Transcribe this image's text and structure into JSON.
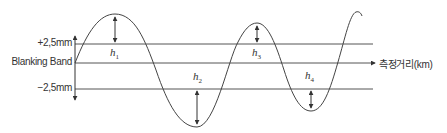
{
  "diagram": {
    "y_labels": {
      "upper": "+2,5mm",
      "center": "Blanking Band",
      "lower": "−2,5mm"
    },
    "x_axis_label": "측정거리(km)",
    "heights": [
      {
        "symbol": "h",
        "sub": "1"
      },
      {
        "symbol": "h",
        "sub": "2"
      },
      {
        "symbol": "h",
        "sub": "3"
      },
      {
        "symbol": "h",
        "sub": "4"
      }
    ],
    "colors": {
      "line": "#555555",
      "curve": "#444444",
      "text": "#333333"
    }
  }
}
